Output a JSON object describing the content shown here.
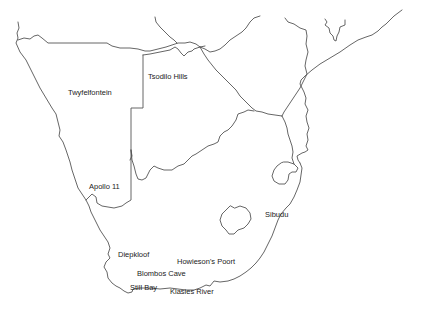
{
  "map": {
    "region": "Southern Africa",
    "line_color": "#555555",
    "label_color": "#222222",
    "background": "#ffffff",
    "sites": [
      {
        "id": "twyfelfontein",
        "label": "Twyfelfontein",
        "x": 68,
        "y": 89
      },
      {
        "id": "tsodilo-hills",
        "label": "Tsodilo Hills",
        "x": 148,
        "y": 73
      },
      {
        "id": "apollo-11",
        "label": "Apollo 11",
        "x": 89,
        "y": 183
      },
      {
        "id": "sibudu",
        "label": "Sibudu",
        "x": 265,
        "y": 211
      },
      {
        "id": "diepkloof",
        "label": "Diepkloof",
        "x": 118,
        "y": 251
      },
      {
        "id": "howiesons-poort",
        "label": "Howieson's Poort",
        "x": 177,
        "y": 258
      },
      {
        "id": "blombos-cave",
        "label": "Blombos Cave",
        "x": 137,
        "y": 270
      },
      {
        "id": "still-bay",
        "label": "Still Bay",
        "x": 130,
        "y": 284
      },
      {
        "id": "klasies-river",
        "label": "Klasies River",
        "x": 170,
        "y": 288
      }
    ]
  }
}
